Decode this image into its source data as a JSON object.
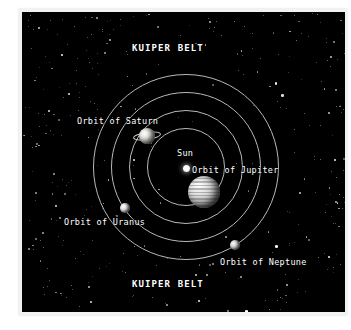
{
  "diagram": {
    "title_top": "KUIPER BELT",
    "title_bottom": "KUIPER BELT",
    "background_color": "#000000",
    "orbit_line_color": "#b9b9bd",
    "label_color": "#ffffff",
    "frame_color": "#f2f2f2"
  },
  "labels": {
    "kuiper_belt_top": "KUIPER BELT",
    "kuiper_belt_bottom": "KUIPER BELT",
    "sun": "Sun",
    "orbit_of_saturn": "Orbit of Saturn",
    "orbit_of_jupiter": "Orbit of Jupiter",
    "orbit_of_uranus": "Orbit of Uranus",
    "orbit_of_neptune": "Orbit of Neptune"
  },
  "bodies": [
    {
      "name": "Sun",
      "kind": "star",
      "radius_px": 3
    },
    {
      "name": "Jupiter",
      "kind": "planet",
      "radius_px": 16,
      "has_bands": true
    },
    {
      "name": "Saturn",
      "kind": "planet",
      "radius_px": 8,
      "has_ring": true
    },
    {
      "name": "Uranus",
      "kind": "planet",
      "radius_px": 5
    },
    {
      "name": "Neptune",
      "kind": "planet",
      "radius_px": 5
    }
  ],
  "orbits": [
    {
      "name": "Orbit of Jupiter",
      "radius_px": 38
    },
    {
      "name": "Orbit of Saturn",
      "radius_px": 56
    },
    {
      "name": "Orbit of Uranus",
      "radius_px": 74
    },
    {
      "name": "Orbit of Neptune",
      "radius_px": 92
    }
  ],
  "starfield": {
    "count": 520,
    "color": "#ffffff"
  }
}
